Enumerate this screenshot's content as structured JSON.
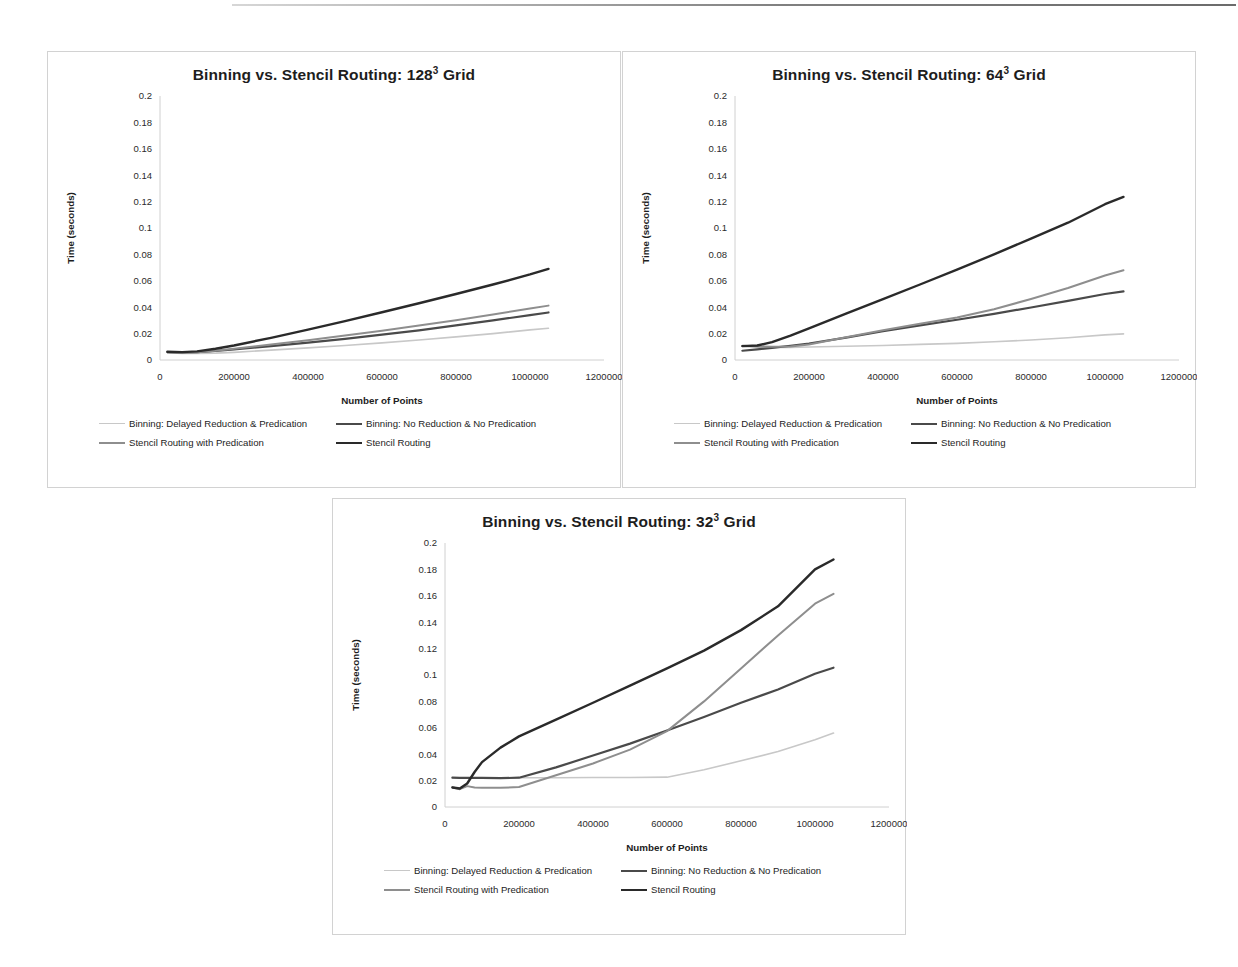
{
  "page": {
    "background": "#ffffff",
    "rule_color": "#555555"
  },
  "series_styles": {
    "binning_delayed": {
      "color": "#c8c8c8",
      "width": 1.6
    },
    "binning_noreduction": {
      "color": "#4a4a4a",
      "width": 2.2
    },
    "stencil_predication": {
      "color": "#8e8e8e",
      "width": 2.0
    },
    "stencil_routing": {
      "color": "#2a2a2a",
      "width": 2.4
    }
  },
  "legend": {
    "items": [
      {
        "label": "Binning: Delayed Reduction & Predication",
        "key": "binning_delayed"
      },
      {
        "label": "Binning: No Reduction & No Predication",
        "key": "binning_noreduction"
      },
      {
        "label": "Stencil Routing with Predication",
        "key": "stencil_predication"
      },
      {
        "label": "Stencil Routing",
        "key": "stencil_routing"
      }
    ]
  },
  "axes": {
    "xlabel": "Number of Points",
    "ylabel": "Time (seconds)",
    "xticks": [
      "0",
      "200000",
      "400000",
      "600000",
      "800000",
      "1000000",
      "1200000"
    ],
    "yticks": [
      "0",
      "0.02",
      "0.04",
      "0.06",
      "0.08",
      "0.1",
      "0.12",
      "0.14",
      "0.16",
      "0.18",
      "0.2"
    ]
  },
  "chart_data": [
    {
      "id": "grid-128",
      "type": "line",
      "title": "Binning vs. Stencil Routing: 128³ Grid",
      "title_base": "Binning vs. Stencil Routing: 128",
      "title_sup": "3",
      "title_tail": " Grid",
      "xlabel": "Number of Points",
      "ylabel": "Time (seconds)",
      "xlim": [
        0,
        1200000
      ],
      "ylim": [
        0,
        0.2
      ],
      "grid": false,
      "legend_position": "bottom",
      "x": [
        20000,
        60000,
        100000,
        150000,
        200000,
        300000,
        400000,
        500000,
        600000,
        700000,
        800000,
        900000,
        1000000,
        1050000
      ],
      "series": [
        {
          "name": "Binning: Delayed Reduction & Predication",
          "key": "binning_delayed",
          "values": [
            0.0055,
            0.005,
            0.005,
            0.0052,
            0.0058,
            0.0075,
            0.0092,
            0.011,
            0.013,
            0.0152,
            0.0175,
            0.02,
            0.0228,
            0.024
          ]
        },
        {
          "name": "Binning: No Reduction & No Predication",
          "key": "binning_noreduction",
          "values": [
            0.006,
            0.0058,
            0.006,
            0.0068,
            0.008,
            0.0105,
            0.0132,
            0.016,
            0.0192,
            0.0225,
            0.0262,
            0.03,
            0.034,
            0.036
          ]
        },
        {
          "name": "Stencil Routing with Predication",
          "key": "stencil_predication",
          "values": [
            0.0058,
            0.0055,
            0.0058,
            0.007,
            0.0085,
            0.0118,
            0.015,
            0.0185,
            0.0222,
            0.0262,
            0.0302,
            0.0345,
            0.039,
            0.0412
          ]
        },
        {
          "name": "Stencil Routing",
          "key": "stencil_routing",
          "values": [
            0.0062,
            0.006,
            0.0065,
            0.0085,
            0.011,
            0.0168,
            0.023,
            0.0295,
            0.0362,
            0.043,
            0.05,
            0.0572,
            0.0648,
            0.069
          ]
        }
      ]
    },
    {
      "id": "grid-64",
      "type": "line",
      "title": "Binning vs. Stencil Routing: 64³ Grid",
      "title_base": "Binning vs. Stencil Routing: 64",
      "title_sup": "3",
      "title_tail": " Grid",
      "xlabel": "Number of Points",
      "ylabel": "Time (seconds)",
      "xlim": [
        0,
        1200000
      ],
      "ylim": [
        0,
        0.2
      ],
      "grid": false,
      "legend_position": "bottom",
      "x": [
        20000,
        60000,
        100000,
        150000,
        200000,
        300000,
        400000,
        500000,
        600000,
        700000,
        800000,
        900000,
        1000000,
        1050000
      ],
      "series": [
        {
          "name": "Binning: Delayed Reduction & Predication",
          "key": "binning_delayed",
          "values": [
            0.0105,
            0.0098,
            0.0096,
            0.0096,
            0.0098,
            0.0104,
            0.011,
            0.0118,
            0.0126,
            0.0138,
            0.0152,
            0.0168,
            0.019,
            0.0198
          ]
        },
        {
          "name": "Binning: No Reduction & No Predication",
          "key": "binning_noreduction",
          "values": [
            0.007,
            0.008,
            0.0092,
            0.0108,
            0.0125,
            0.017,
            0.0218,
            0.0262,
            0.0305,
            0.035,
            0.0398,
            0.0448,
            0.05,
            0.052
          ]
        },
        {
          "name": "Stencil Routing with Predication",
          "key": "stencil_predication",
          "values": [
            0.0108,
            0.0102,
            0.01,
            0.0102,
            0.0118,
            0.0172,
            0.0225,
            0.0275,
            0.0322,
            0.0385,
            0.0462,
            0.0545,
            0.064,
            0.068
          ]
        },
        {
          "name": "Stencil Routing",
          "key": "stencil_routing",
          "values": [
            0.0105,
            0.011,
            0.0135,
            0.0185,
            0.024,
            0.0352,
            0.0462,
            0.0572,
            0.0685,
            0.08,
            0.092,
            0.104,
            0.118,
            0.1235
          ]
        }
      ]
    },
    {
      "id": "grid-32",
      "type": "line",
      "title": "Binning vs. Stencil Routing: 32³ Grid",
      "title_base": "Binning vs. Stencil Routing: 32",
      "title_sup": "3",
      "title_tail": " Grid",
      "xlabel": "Number of Points",
      "ylabel": "Time (seconds)",
      "xlim": [
        0,
        1200000
      ],
      "ylim": [
        0,
        0.2
      ],
      "grid": false,
      "legend_position": "bottom",
      "x": [
        20000,
        40000,
        60000,
        80000,
        100000,
        150000,
        200000,
        300000,
        400000,
        500000,
        600000,
        700000,
        800000,
        900000,
        1000000,
        1050000
      ],
      "series": [
        {
          "name": "Binning: Delayed Reduction & Predication",
          "key": "binning_delayed",
          "values": [
            0.0222,
            0.0218,
            0.022,
            0.022,
            0.022,
            0.0221,
            0.0222,
            0.0222,
            0.0223,
            0.0224,
            0.0226,
            0.0282,
            0.035,
            0.042,
            0.051,
            0.056
          ]
        },
        {
          "name": "Binning: No Reduction & No Predication",
          "key": "binning_noreduction",
          "values": [
            0.0222,
            0.022,
            0.0221,
            0.0221,
            0.022,
            0.0218,
            0.0222,
            0.03,
            0.039,
            0.048,
            0.058,
            0.0682,
            0.079,
            0.089,
            0.101,
            0.1055
          ]
        },
        {
          "name": "Stencil Routing with Predication",
          "key": "stencil_predication",
          "values": [
            0.015,
            0.0135,
            0.0158,
            0.0148,
            0.0145,
            0.0145,
            0.0152,
            0.024,
            0.033,
            0.0435,
            0.0575,
            0.08,
            0.105,
            0.13,
            0.154,
            0.1615
          ]
        },
        {
          "name": "Stencil Routing",
          "key": "stencil_routing",
          "values": [
            0.0148,
            0.014,
            0.0178,
            0.0265,
            0.034,
            0.045,
            0.0535,
            0.0662,
            0.079,
            0.092,
            0.105,
            0.1185,
            0.134,
            0.152,
            0.18,
            0.1875
          ]
        }
      ]
    }
  ]
}
